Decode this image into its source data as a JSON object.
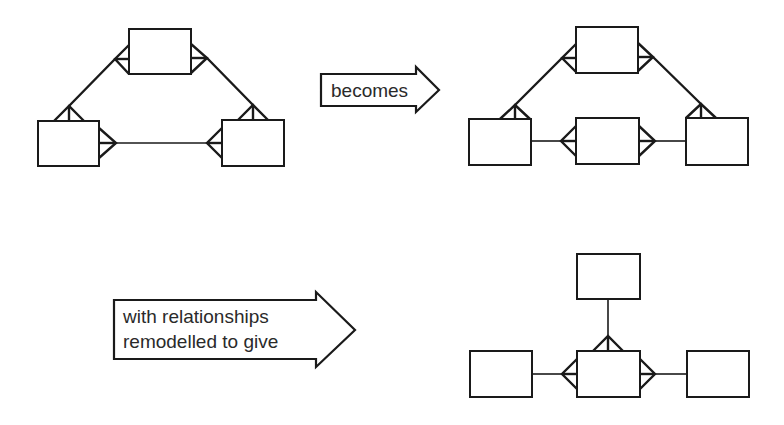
{
  "figure": {
    "background_color": "#ffffff",
    "line_color": "#1a1a1a"
  },
  "arrows": [
    {
      "id": "arrow-becomes",
      "lines": [
        "becomes"
      ]
    },
    {
      "id": "arrow-remodelled",
      "lines": [
        "with relationships",
        "remodelled to give"
      ]
    }
  ],
  "diagrams": [
    {
      "name": "original-triangle",
      "entities": 3,
      "relationships": [
        "top-to-left many-to-many",
        "top-to-right many-to-many",
        "left-to-right many-to-many"
      ]
    },
    {
      "name": "intermediate-with-link-entity",
      "entities": 4,
      "relationships": [
        "top-to-left many-to-many",
        "top-to-right many-to-many",
        "left one-to-many middle",
        "right one-to-many middle"
      ]
    },
    {
      "name": "final-star",
      "entities": 4,
      "relationships": [
        "top one-to-many middle",
        "left one-to-many middle",
        "right one-to-many middle"
      ]
    }
  ]
}
